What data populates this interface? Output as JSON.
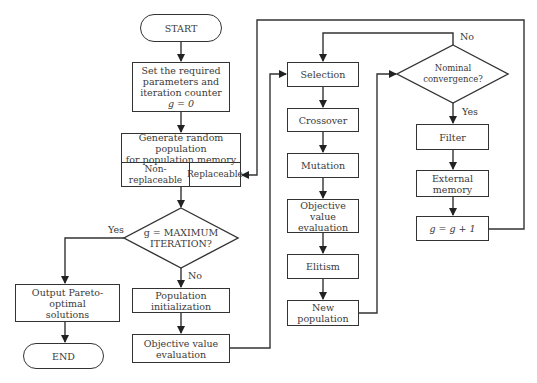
{
  "diagram": {
    "type": "flowchart",
    "nodes": {
      "start": "START",
      "set_params": {
        "lines": [
          "Set the required",
          "parameters and",
          "iteration counter"
        ],
        "formula": "g = 0"
      },
      "generate": {
        "lines": [
          "Generate random population",
          "for population memory"
        ]
      },
      "non_replaceable": "Non-replaceable",
      "replaceable": "Replaceable",
      "max_iter": {
        "lines": [
          "g = MAXIMUM",
          "ITERATION?"
        ]
      },
      "output": {
        "lines": [
          "Output Pareto-optimal",
          "solutions"
        ]
      },
      "end": "END",
      "pop_init": "Population initialization",
      "obj_eval_1": {
        "lines": [
          "Objective value",
          "evaluation"
        ]
      },
      "selection": "Selection",
      "crossover": "Crossover",
      "mutation": "Mutation",
      "obj_eval_2": {
        "lines": [
          "Objective value",
          "evaluation"
        ]
      },
      "elitism": "Elitism",
      "new_population": "New population",
      "nominal_conv": "Nominal convergence?",
      "filter": "Filter",
      "external_memory": "External memory",
      "increment": "g = g + 1"
    },
    "edge_labels": {
      "yes_max": "Yes",
      "no_max": "No",
      "no_conv": "No",
      "yes_conv": "Yes"
    },
    "colors": {
      "stroke": "#333333",
      "text": "#3a3a3a",
      "background": "#ffffff"
    }
  }
}
